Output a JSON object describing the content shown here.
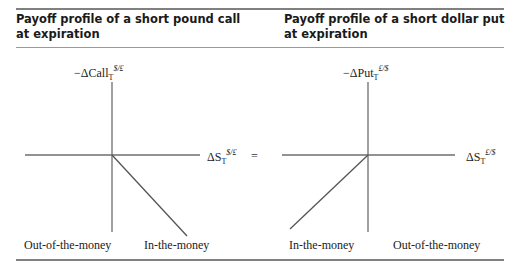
{
  "panels": [
    {
      "title_line1": "Payoff profile of a short pound call",
      "title_line2": "at expiration",
      "y_axis": {
        "prefix": "−ΔCall",
        "sub": "T",
        "sup": "$/£"
      },
      "x_axis": {
        "prefix": "ΔS",
        "sub": "T",
        "sup": "$/£"
      },
      "region_left": "Out-of-the-money",
      "region_right": "In-the-money"
    },
    {
      "title_line1": "Payoff profile of a short dollar put",
      "title_line2": "at expiration",
      "y_axis": {
        "prefix": "−ΔPut",
        "sub": "T",
        "sup": "£/$"
      },
      "x_axis": {
        "prefix": "ΔS",
        "sub": "T",
        "sup": "£/$"
      },
      "region_left": "In-the-money",
      "region_right": "Out-of-the-money"
    }
  ],
  "equals_sign": "=",
  "colors": {
    "rule": "#808080",
    "axis": "#6e6e6e",
    "text": "#222222"
  }
}
